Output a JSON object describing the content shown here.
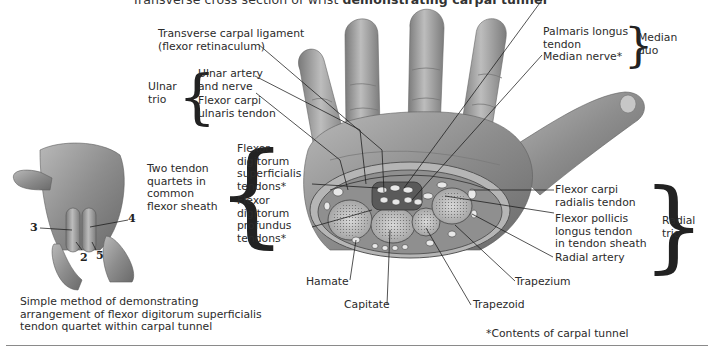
{
  "title": {
    "prefix": "Transverse cross section of wrist ",
    "emphasis": "demonstrating carpal tunnel"
  },
  "labels": {
    "transverse_carpal_ligament": [
      "Transverse carpal ligament",
      "(flexor retinaculum)"
    ],
    "ulnar_trio_group": [
      "Ulnar",
      "trio"
    ],
    "ulnar_artery_nerve": [
      "Ulnar artery",
      "and nerve"
    ],
    "flexor_carpi_ulnaris": [
      "Flexor carpi",
      "ulnaris tendon"
    ],
    "two_tendon_quartets_group": [
      "Two tendon",
      "quartets in",
      "common",
      "flexor sheath"
    ],
    "fds_tendons": [
      "Flexor",
      "digitorum",
      "superficialis",
      "tendons*"
    ],
    "fdp_tendons": [
      "Flexor",
      "digitorum",
      "profundus",
      "tendons*"
    ],
    "palmaris_longus": [
      "Palmaris longus",
      "tendon"
    ],
    "median_nerve": [
      "Median nerve*"
    ],
    "median_duo_group": [
      "Median",
      "duo"
    ],
    "flexor_carpi_radialis": [
      "Flexor carpi",
      "radialis tendon"
    ],
    "flexor_pollicis_longus": [
      "Flexor pollicis",
      "longus tendon",
      "in tendon sheath"
    ],
    "radial_artery": [
      "Radial artery"
    ],
    "radial_trio_group": [
      "Radial",
      "trio"
    ],
    "hamate": "Hamate",
    "capitate": "Capitate",
    "trapezoid": "Trapezoid",
    "trapezium": "Trapezium"
  },
  "inset": {
    "finger_numbers": {
      "n2": "2",
      "n3": "3",
      "n4": "4",
      "n5": "5"
    },
    "caption": [
      "Simple method of demonstrating",
      "arrangement of flexor digitorum superficialis",
      "tendon quartet within carpal tunnel"
    ]
  },
  "footnote": "*Contents of carpal tunnel",
  "colors": {
    "skin_dark": "#6e6e6e",
    "skin_mid": "#a3a3a3",
    "skin_light": "#d4d4d4",
    "leader": "#1a1a1a",
    "rule": "#8a8a8a"
  }
}
